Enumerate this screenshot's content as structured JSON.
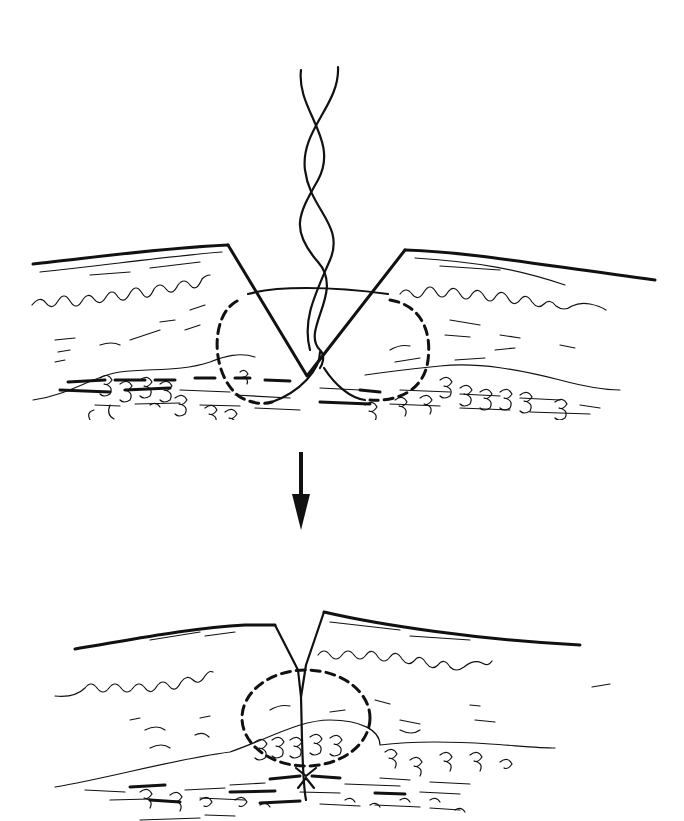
{
  "figure": {
    "type": "medical-illustration",
    "style": "black-and-white line drawing",
    "colors": {
      "ink": "#111111",
      "background": "#ffffff"
    },
    "panels": [
      {
        "id": "before",
        "description": "V-shaped wound through skin layers with a twisted suture thread looping through both wound edges; dashed circles show the buried path of the suture",
        "elements": [
          "skin-surface",
          "epidermis-wavy-layer",
          "dermis-strokes",
          "fat-lobules",
          "fascia-strokes",
          "v-shaped-wound",
          "twisted-suture-thread",
          "solid-suture-arc",
          "dashed-suture-path-left",
          "dashed-suture-path-right"
        ]
      },
      {
        "id": "after",
        "description": "Wound edges approximated, closed incision line with knotted suture buried at the bottom; dashed circle shows the suture loop",
        "elements": [
          "skin-surface",
          "epidermis-wavy-layer",
          "dermis-strokes",
          "fat-lobules",
          "fascia-strokes",
          "closed-incision-line",
          "dashed-suture-loop",
          "buried-knot"
        ]
      }
    ],
    "transition": {
      "icon": "down-arrow-icon",
      "meaning": "result after tying"
    }
  }
}
